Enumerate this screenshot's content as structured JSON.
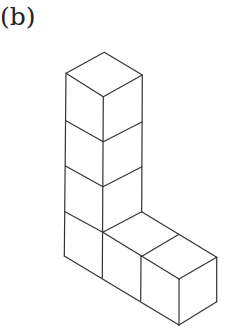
{
  "figure": {
    "label": "(b)",
    "cube_count": 6,
    "stroke_color": "#333333",
    "background": "#ffffff"
  }
}
